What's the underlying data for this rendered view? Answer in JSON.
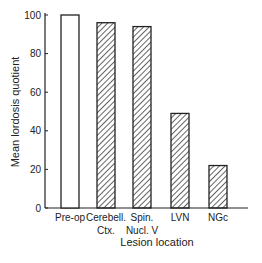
{
  "chart_data": {
    "type": "bar",
    "title": "",
    "xlabel": "Lesion location",
    "ylabel": "Mean lordosis quotient",
    "ylim": [
      0,
      100
    ],
    "yticks": [
      0,
      20,
      40,
      60,
      80,
      100
    ],
    "grid": false,
    "categories": [
      {
        "line1": "Pre-op",
        "line2": ""
      },
      {
        "line1": "Cerebell.",
        "line2": "Ctx."
      },
      {
        "line1": "Spin.",
        "line2": "Nucl. V"
      },
      {
        "line1": "LVN",
        "line2": ""
      },
      {
        "line1": "NGc",
        "line2": ""
      }
    ],
    "values": [
      100,
      96,
      94,
      49,
      22
    ],
    "fills": [
      "open",
      "hatched",
      "hatched",
      "hatched",
      "hatched"
    ],
    "colors": {
      "ink": "#222222",
      "background": "#ffffff"
    }
  }
}
